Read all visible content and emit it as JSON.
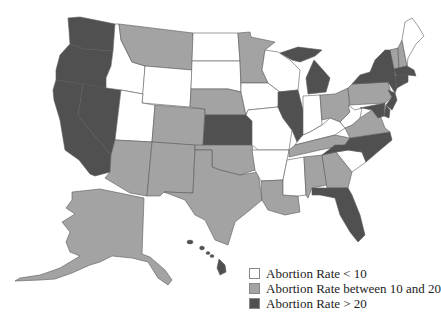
{
  "map": {
    "title": "Abortion rate by US state",
    "colors": {
      "low": "#ffffff",
      "mid": "#a3a3a3",
      "high": "#505050",
      "border": "#5a5a5a"
    },
    "legend": [
      {
        "key": "low",
        "label": "Abortion Rate < 10",
        "color": "#ffffff"
      },
      {
        "key": "mid",
        "label": "Abortion Rate between 10 and 20",
        "color": "#a3a3a3"
      },
      {
        "key": "high",
        "label": "Abortion Rate > 20",
        "color": "#505050"
      }
    ],
    "states": {
      "WA": "high",
      "OR": "high",
      "CA": "high",
      "NV": "high",
      "ID": "low",
      "MT": "mid",
      "WY": "low",
      "UT": "low",
      "CO": "mid",
      "AZ": "mid",
      "NM": "mid",
      "ND": "low",
      "SD": "low",
      "NE": "mid",
      "KS": "high",
      "OK": "mid",
      "TX": "mid",
      "MN": "mid",
      "IA": "low",
      "MO": "low",
      "AR": "low",
      "LA": "mid",
      "WI": "low",
      "IL": "high",
      "MI": "high",
      "IN": "low",
      "OH": "mid",
      "KY": "low",
      "TN": "mid",
      "MS": "low",
      "AL": "mid",
      "GA": "mid",
      "FL": "high",
      "SC": "low",
      "NC": "high",
      "VA": "mid",
      "WV": "low",
      "PA": "mid",
      "NY": "high",
      "NJ": "high",
      "DE": "high",
      "MD": "high",
      "CT": "high",
      "RI": "high",
      "MA": "high",
      "VT": "mid",
      "NH": "mid",
      "ME": "low",
      "AK": "mid",
      "HI": "high"
    }
  }
}
